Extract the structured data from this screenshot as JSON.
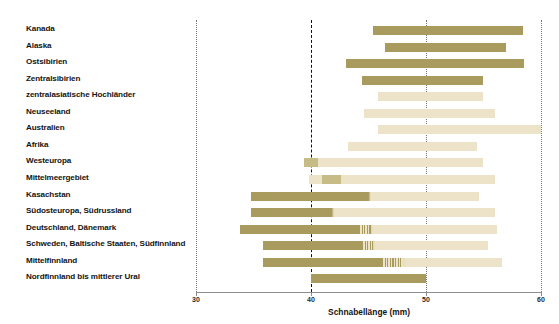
{
  "chart_data": {
    "type": "bar",
    "orientation": "horizontal",
    "title": "",
    "xlabel": "Schnabellänge (mm)",
    "ylabel": "",
    "xlim": [
      30,
      60
    ],
    "xticks": [
      30,
      40,
      50,
      60
    ],
    "xticklabels": [
      "30",
      "40",
      "50",
      "60"
    ],
    "grid": "vertical dotted gridlines at 30, 40, 50, 60; bold dashed reference line at 40",
    "reference_line": 40,
    "legend": "none",
    "colors": {
      "dark": "#a99a5e",
      "mid": "#c7bb86",
      "light": "#ece3c8",
      "reference_line": "#111111",
      "gridline": "#7a7a7a",
      "axis": "#8e8e8e"
    },
    "categories": [
      "Kanada",
      "Alaska",
      "Ostsibirien",
      "Zentralsibirien",
      "zentralasiatische Hochländer",
      "Neuseeland",
      "Australien",
      "Afrika",
      "Westeuropa",
      "Mittelmeergebiet",
      "Kasachstan",
      "Südosteuropa, Südrussland",
      "Deutschland, Dänemark",
      "Schweden, Baltische Staaten, Südfinnland",
      "Mittelfinnland",
      "Nordfinnland bis mittlerer Ural"
    ],
    "ranges": [
      {
        "category": "Kanada",
        "min": 45.4,
        "max": 58.4,
        "shade": "dark"
      },
      {
        "category": "Alaska",
        "min": 46.4,
        "max": 57.0,
        "shade": "dark"
      },
      {
        "category": "Ostsibirien",
        "min": 43.0,
        "max": 58.5,
        "shade": "dark"
      },
      {
        "category": "Zentralsibirien",
        "min": 44.4,
        "max": 55.0,
        "shade": "dark"
      },
      {
        "category": "zentralasiatische Hochländer",
        "min": 45.8,
        "max": 55.0,
        "shade": "light"
      },
      {
        "category": "Neuseeland",
        "min": 44.6,
        "max": 56.0,
        "shade": "light"
      },
      {
        "category": "Australien",
        "min": 45.8,
        "max": 60.0,
        "shade": "light"
      },
      {
        "category": "Afrika",
        "min": 43.2,
        "max": 54.4,
        "shade": "light"
      },
      {
        "category": "Westeuropa",
        "min": 39.4,
        "max": 55.0,
        "shade": "light",
        "dark_from": 39.4,
        "dark_to": 40.6
      },
      {
        "category": "Mittelmeergebiet",
        "min": 39.8,
        "max": 56.0,
        "shade": "light",
        "dark_from": 41.0,
        "dark_to": 42.6
      },
      {
        "category": "Kasachstan",
        "min": 34.8,
        "max": 54.6,
        "shade": "gradient",
        "dark_to": 45.0
      },
      {
        "category": "Südosteuropa, Südrussland",
        "min": 34.8,
        "max": 56.0,
        "shade": "gradient",
        "dark_to": 41.8
      },
      {
        "category": "Deutschland, Dänemark",
        "min": 33.8,
        "max": 56.2,
        "shade": "gradient",
        "dark_to": 44.2,
        "striped_from": 44.2,
        "striped_to": 45.2
      },
      {
        "category": "Schweden, Baltische Staaten, Südfinnland",
        "min": 35.8,
        "max": 55.4,
        "shade": "gradient",
        "dark_to": 44.4,
        "striped_from": 44.4,
        "striped_to": 45.4
      },
      {
        "category": "Mittelfinnland",
        "min": 35.8,
        "max": 56.6,
        "shade": "gradient",
        "dark_to": 46.2,
        "striped_from": 46.2,
        "striped_to": 48.0
      },
      {
        "category": "Nordfinnland bis mittlerer Ural",
        "min": 40.0,
        "max": 50.0,
        "shade": "dark"
      }
    ]
  }
}
